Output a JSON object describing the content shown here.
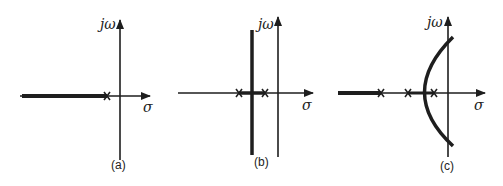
{
  "figure": {
    "axis_labels": {
      "imaginary": "jω",
      "real": "σ"
    },
    "colors": {
      "ink": "#1e1e1e",
      "background": "#ffffff"
    },
    "panels": [
      {
        "caption": "(a)",
        "poles": 1,
        "locus": "single pole on negative real axis; locus runs along real axis to -∞"
      },
      {
        "caption": "(b)",
        "poles": 2,
        "locus": "two real poles; locus breaks away vertically at midpoint (vertical line)"
      },
      {
        "caption": "(c)",
        "poles": 3,
        "locus": "three real poles; real-axis segment left of leftmost pole, and curved branches crossing into right half-plane"
      }
    ]
  }
}
